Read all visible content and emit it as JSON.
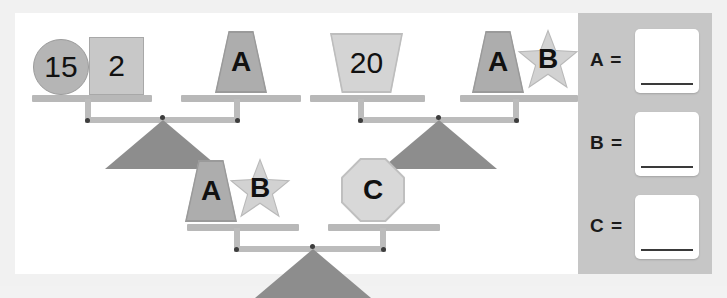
{
  "worksheet": {
    "title": "Balance Scales Puzzle",
    "background_color": "#f1f1f1",
    "panel_color": "#ffffff",
    "answer_panel_color": "#c6c6c6"
  },
  "balances": [
    {
      "id": "balance-1",
      "left_items": [
        {
          "shape": "circle",
          "label": "15",
          "fill": "#b5b5b5"
        },
        {
          "shape": "square",
          "label": "2",
          "fill": "#c8c8c8"
        }
      ],
      "right_items": [
        {
          "shape": "trapezoid",
          "label": "A",
          "fill": "#adadad"
        }
      ]
    },
    {
      "id": "balance-2",
      "left_items": [
        {
          "shape": "trapezoid-wide",
          "label": "20",
          "fill": "#d4d4d4"
        }
      ],
      "right_items": [
        {
          "shape": "trapezoid",
          "label": "A",
          "fill": "#adadad"
        },
        {
          "shape": "star",
          "label": "B",
          "fill": "#d2d2d2"
        }
      ]
    },
    {
      "id": "balance-3",
      "left_items": [
        {
          "shape": "trapezoid",
          "label": "A",
          "fill": "#adadad"
        },
        {
          "shape": "star",
          "label": "B",
          "fill": "#d2d2d2"
        }
      ],
      "right_items": [
        {
          "shape": "octagon",
          "label": "C",
          "fill": "#d8d8d8"
        }
      ]
    }
  ],
  "answers": [
    {
      "label": "A =",
      "value": "",
      "placeholder": ""
    },
    {
      "label": "B =",
      "value": "",
      "placeholder": ""
    },
    {
      "label": "C =",
      "value": "",
      "placeholder": ""
    }
  ]
}
